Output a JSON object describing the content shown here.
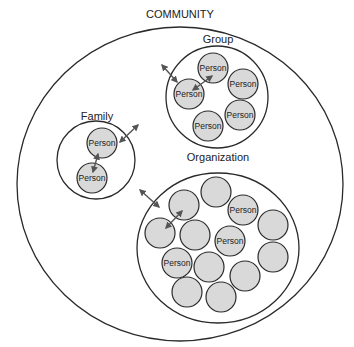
{
  "diagram": {
    "title": "COMMUNITY",
    "colors": {
      "person_fill": "#d9d9d9",
      "stroke": "#2a2a2a",
      "arrow": "#555555",
      "background": "#ffffff"
    },
    "community": {
      "label": "COMMUNITY",
      "cx": 180,
      "cy": 184,
      "rx": 163,
      "ry": 157
    },
    "group": {
      "label": "Group",
      "cx": 217,
      "cy": 97,
      "r": 51,
      "persons": [
        {
          "label": "Person",
          "cx": 213,
          "cy": 68
        },
        {
          "label": "Person",
          "cx": 243,
          "cy": 84
        },
        {
          "label": "Person",
          "cx": 189,
          "cy": 94
        },
        {
          "label": "Person",
          "cx": 240,
          "cy": 115
        },
        {
          "label": "Person",
          "cx": 208,
          "cy": 126
        }
      ]
    },
    "family": {
      "label": "Family",
      "cx": 96,
      "cy": 160,
      "r": 39,
      "persons": [
        {
          "label": "Person",
          "cx": 102,
          "cy": 143
        },
        {
          "label": "Person",
          "cx": 92,
          "cy": 178
        }
      ]
    },
    "organization": {
      "label": "Organization",
      "cx": 218,
      "cy": 248,
      "rx": 81,
      "ry": 75,
      "persons": [
        {
          "label": "",
          "cx": 216,
          "cy": 192
        },
        {
          "label": "",
          "cx": 184,
          "cy": 205
        },
        {
          "label": "Person",
          "cx": 243,
          "cy": 210
        },
        {
          "label": "",
          "cx": 273,
          "cy": 225
        },
        {
          "label": "",
          "cx": 160,
          "cy": 233
        },
        {
          "label": "",
          "cx": 195,
          "cy": 235
        },
        {
          "label": "Person",
          "cx": 230,
          "cy": 241
        },
        {
          "label": "",
          "cx": 273,
          "cy": 257
        },
        {
          "label": "Person",
          "cx": 177,
          "cy": 263
        },
        {
          "label": "",
          "cx": 209,
          "cy": 267
        },
        {
          "label": "",
          "cx": 245,
          "cy": 276
        },
        {
          "label": "",
          "cx": 187,
          "cy": 292
        },
        {
          "label": "",
          "cx": 221,
          "cy": 297
        }
      ]
    },
    "person_radius": 15,
    "arrows": [
      {
        "name": "group-boundary-arrow",
        "x1": 162,
        "y1": 65,
        "x2": 177,
        "y2": 82
      },
      {
        "name": "group-internal-arrow",
        "x1": 193,
        "y1": 90,
        "x2": 212,
        "y2": 76
      },
      {
        "name": "family-boundary-arrow",
        "x1": 120,
        "y1": 142,
        "x2": 138,
        "y2": 125
      },
      {
        "name": "family-internal-arrow",
        "x1": 98,
        "y1": 154,
        "x2": 93,
        "y2": 172
      },
      {
        "name": "organization-boundary-arrow",
        "x1": 140,
        "y1": 190,
        "x2": 159,
        "y2": 207
      },
      {
        "name": "organization-internal-arrow",
        "x1": 166,
        "y1": 228,
        "x2": 182,
        "y2": 211
      }
    ],
    "label_positions": {
      "community": {
        "x": 180,
        "y": 18
      },
      "group": {
        "x": 218,
        "y": 43
      },
      "family": {
        "x": 97,
        "y": 120
      },
      "organization": {
        "x": 218,
        "y": 161
      }
    }
  }
}
